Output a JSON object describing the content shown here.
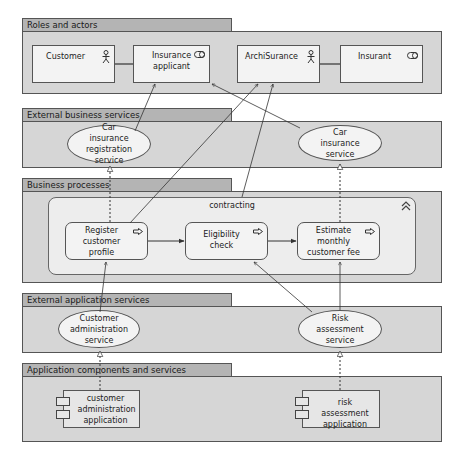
{
  "groups": {
    "roles": {
      "title": "Roles and actors"
    },
    "ext_business": {
      "title": "External business services"
    },
    "business_processes": {
      "title": "Business processes"
    },
    "ext_application": {
      "title": "External application services"
    },
    "app_components": {
      "title": "Application components and services"
    }
  },
  "roles": {
    "customer": "Customer",
    "insurance_applicant": "Insurance applicant",
    "archisurance": "ArchiSurance",
    "insurant": "Insurant"
  },
  "business_services": {
    "car_registration": "Car insurance registration service",
    "car_insurance": "Car insurance service"
  },
  "processes": {
    "contracting": "contracting",
    "register": "Register customer profile",
    "eligibility": "Eligibility check",
    "estimate": "Estimate monthly customer fee"
  },
  "app_services": {
    "customer_admin": "Customer administration service",
    "risk": "Risk assessment service"
  },
  "components": {
    "customer_admin_app": "customer administration application",
    "risk_app": "risk assessment application"
  },
  "colors": {
    "group_tab": "#b4b4b4",
    "group_body": "#d6d6d6",
    "element_fill": "#f3f3f3",
    "border": "#555555"
  }
}
